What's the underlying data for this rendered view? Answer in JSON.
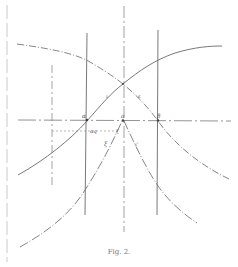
{
  "figure": {
    "caption": "Fig. 2.",
    "labels": {
      "alpha": "α",
      "beta": "β",
      "x0": "a",
      "curve_left": "ι",
      "curve_right": "ε",
      "lower_left": "ξ",
      "lower_right": "ι'",
      "dim_label": "ɑq",
      "sub_label": "ζ"
    },
    "colors": {
      "line": "#6a6a6a",
      "dashed": "#8a8a8a"
    }
  }
}
